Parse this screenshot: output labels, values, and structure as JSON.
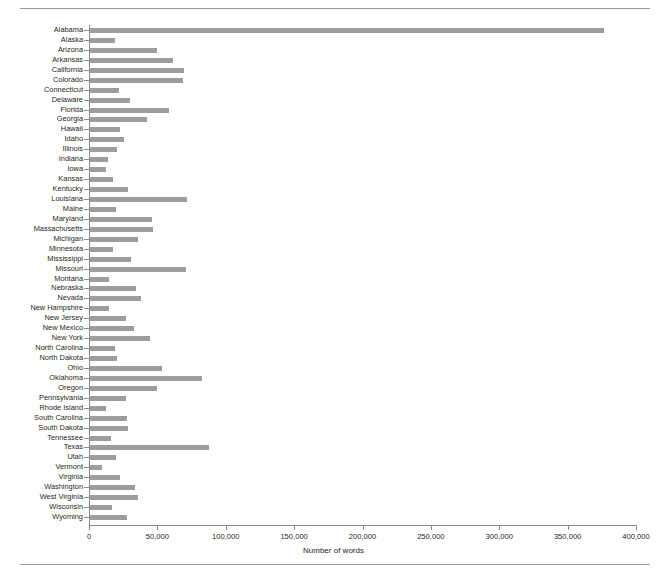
{
  "figure": {
    "top_rule": true,
    "bottom_rule": true,
    "background_color": "#ffffff",
    "bar_color": "#9d9d9d",
    "axis_color": "#8c8c8c",
    "text_color": "#231f20"
  },
  "chart_data": {
    "type": "bar",
    "orientation": "horizontal",
    "title": "",
    "xlabel": "Number of words",
    "ylabel": "",
    "xlim": [
      0,
      400000
    ],
    "ylim": null,
    "grid": false,
    "legend": null,
    "xticks": [
      0,
      50000,
      100000,
      150000,
      200000,
      250000,
      300000,
      350000,
      400000
    ],
    "xtick_labels": [
      "0",
      "50,000",
      "100,000",
      "150,000",
      "200,000",
      "250,000",
      "300,000",
      "350,000",
      "400,000"
    ],
    "categories": [
      "Alabama",
      "Alaska",
      "Arizona",
      "Arkansas",
      "California",
      "Colorado",
      "Connecticut",
      "Delaware",
      "Florida",
      "Georgia",
      "Hawaii",
      "Idaho",
      "Illinois",
      "Indiana",
      "Iowa",
      "Kansas",
      "Kentucky",
      "Louisiana",
      "Maine",
      "Maryland",
      "Massachusetts",
      "Michigan",
      "Minnesota",
      "Mississippi",
      "Missouri",
      "Montana",
      "Nebraska",
      "Nevada",
      "New Hampshire",
      "New Jersey",
      "New Mexico",
      "New York",
      "North Carolina",
      "North Dakota",
      "Ohio",
      "Oklahoma",
      "Oregon",
      "Pennsylvania",
      "Rhode Island",
      "South Carolina",
      "South Dakota",
      "Tennessee",
      "Texas",
      "Utah",
      "Vermont",
      "Virginia",
      "Washington",
      "West Virginia",
      "Wisconsin",
      "Wyoming"
    ],
    "values": [
      376000,
      18000,
      49000,
      61000,
      69000,
      68000,
      21000,
      29000,
      58000,
      42000,
      22000,
      25000,
      20000,
      13000,
      12000,
      17000,
      28000,
      71000,
      19000,
      45000,
      46000,
      35000,
      17000,
      30000,
      70000,
      14000,
      34000,
      37000,
      14000,
      26000,
      32000,
      44000,
      18000,
      20000,
      53000,
      82000,
      49000,
      26000,
      12000,
      27000,
      28000,
      15000,
      87000,
      19000,
      9000,
      22000,
      33000,
      35000,
      16000,
      27000
    ]
  }
}
